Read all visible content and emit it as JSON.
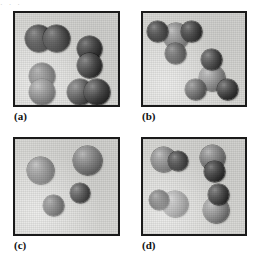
{
  "figure": {
    "top_artifact_text": "·   ·            ·",
    "background_color": "#ffffff",
    "panel_fill_color": "#d9d9d6",
    "panel_border_color": "#1a1a1a",
    "atom_dark_color": "#343434",
    "atom_light_color": "#8d8d8d"
  },
  "panels": [
    {
      "id": "a",
      "caption": "(a)",
      "description": "Four identical diatomic molecules, each made of two equal-size dark atoms",
      "molecule_count": 4,
      "atoms_per_molecule": 2,
      "molecules": [
        {
          "name": "molecule-a1",
          "orientation": "horizontal",
          "atoms": [
            {
              "kind": "dark",
              "size": 27,
              "x": 10,
              "y": 12
            },
            {
              "kind": "dark",
              "size": 27,
              "x": 28,
              "y": 12
            }
          ]
        },
        {
          "name": "molecule-a2",
          "orientation": "vertical",
          "atoms": [
            {
              "kind": "dark",
              "size": 25,
              "x": 62,
              "y": 23
            },
            {
              "kind": "dark",
              "size": 25,
              "x": 62,
              "y": 40
            }
          ]
        },
        {
          "name": "molecule-a3",
          "orientation": "vertical",
          "atoms": [
            {
              "kind": "dark",
              "size": 26,
              "x": 14,
              "y": 50
            },
            {
              "kind": "dark",
              "size": 26,
              "x": 14,
              "y": 66
            }
          ]
        },
        {
          "name": "molecule-a4",
          "orientation": "horizontal",
          "atoms": [
            {
              "kind": "dark",
              "size": 26,
              "x": 52,
              "y": 66
            },
            {
              "kind": "dark",
              "size": 26,
              "x": 69,
              "y": 66
            }
          ]
        }
      ]
    },
    {
      "id": "b",
      "caption": "(b)",
      "description": "Two identical tetrahedral molecules, each a light central atom bonded to three dark atoms",
      "molecule_count": 2,
      "atoms_per_molecule": 4,
      "molecules": [
        {
          "name": "molecule-b1",
          "orientation": "apex-up",
          "atoms": [
            {
              "kind": "light",
              "size": 26,
              "x": 20,
              "y": 10
            },
            {
              "kind": "dark",
              "size": 21,
              "x": 4,
              "y": 8
            },
            {
              "kind": "dark",
              "size": 21,
              "x": 38,
              "y": 8
            },
            {
              "kind": "dark",
              "size": 21,
              "x": 22,
              "y": 30
            }
          ]
        },
        {
          "name": "molecule-b2",
          "orientation": "apex-up",
          "atoms": [
            {
              "kind": "light",
              "size": 26,
              "x": 56,
              "y": 52
            },
            {
              "kind": "dark",
              "size": 21,
              "x": 58,
              "y": 36
            },
            {
              "kind": "dark",
              "size": 21,
              "x": 42,
              "y": 66
            },
            {
              "kind": "dark",
              "size": 21,
              "x": 74,
              "y": 66
            }
          ]
        }
      ]
    },
    {
      "id": "c",
      "caption": "(c)",
      "description": "Four separate unbonded atoms: two large light atoms and two smaller dark atoms",
      "molecule_count": 4,
      "atoms_per_molecule": 1,
      "molecules": [
        {
          "name": "atom-c1",
          "orientation": "single",
          "atoms": [
            {
              "kind": "light",
              "size": 27,
              "x": 12,
              "y": 18
            }
          ]
        },
        {
          "name": "atom-c2",
          "orientation": "single",
          "atoms": [
            {
              "kind": "light",
              "size": 29,
              "x": 58,
              "y": 7
            }
          ]
        },
        {
          "name": "atom-c3",
          "orientation": "single",
          "atoms": [
            {
              "kind": "dark",
              "size": 20,
              "x": 55,
              "y": 44
            }
          ]
        },
        {
          "name": "atom-c4",
          "orientation": "single",
          "atoms": [
            {
              "kind": "dark",
              "size": 21,
              "x": 28,
              "y": 56
            }
          ]
        }
      ]
    },
    {
      "id": "d",
      "caption": "(d)",
      "description": "Four identical diatomic molecules, each a larger light atom bonded to a smaller dark atom",
      "molecule_count": 4,
      "atoms_per_molecule": 2,
      "molecules": [
        {
          "name": "molecule-d1",
          "orientation": "horizontal",
          "atoms": [
            {
              "kind": "light",
              "size": 25,
              "x": 8,
              "y": 8
            },
            {
              "kind": "dark",
              "size": 20,
              "x": 25,
              "y": 12
            }
          ]
        },
        {
          "name": "molecule-d2",
          "orientation": "vertical",
          "atoms": [
            {
              "kind": "light",
              "size": 25,
              "x": 57,
              "y": 6
            },
            {
              "kind": "dark",
              "size": 21,
              "x": 61,
              "y": 22
            }
          ]
        },
        {
          "name": "molecule-d3",
          "orientation": "horizontal",
          "atoms": [
            {
              "kind": "light",
              "size": 26,
              "x": 19,
              "y": 52
            },
            {
              "kind": "dark",
              "size": 20,
              "x": 6,
              "y": 51
            }
          ]
        },
        {
          "name": "molecule-d4",
          "orientation": "vertical",
          "atoms": [
            {
              "kind": "light",
              "size": 26,
              "x": 60,
              "y": 58
            },
            {
              "kind": "dark",
              "size": 21,
              "x": 65,
              "y": 45
            }
          ]
        }
      ]
    }
  ]
}
